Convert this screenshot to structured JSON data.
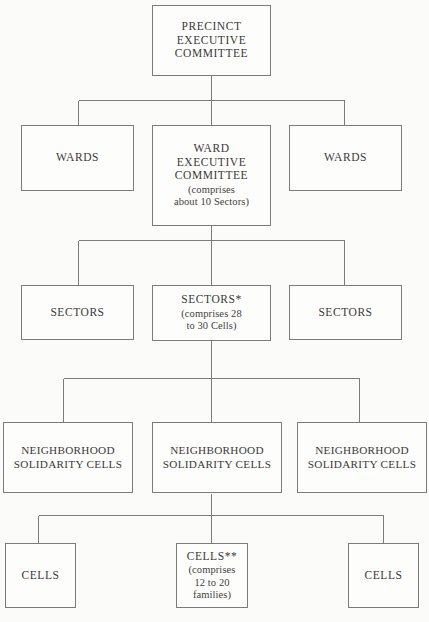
{
  "diagram": {
    "background_color": "#fbfbf9",
    "line_color": "#7c7c7c",
    "text_color": "#3a3a3a",
    "levels": [
      {
        "level": 1,
        "name": "precinct",
        "nodes": [
          {
            "id": "precinct-executive-committee",
            "title": "PRECINCT\nEXECUTIVE\nCOMMITTEE",
            "sub": ""
          }
        ]
      },
      {
        "level": 2,
        "name": "wards",
        "nodes": [
          {
            "id": "wards-left",
            "title": "WARDS",
            "sub": ""
          },
          {
            "id": "ward-executive-committee",
            "title": "WARD\nEXECUTIVE\nCOMMITTEE",
            "sub": "(comprises\nabout 10 Sectors)"
          },
          {
            "id": "wards-right",
            "title": "WARDS",
            "sub": ""
          }
        ]
      },
      {
        "level": 3,
        "name": "sectors",
        "nodes": [
          {
            "id": "sectors-left",
            "title": "SECTORS",
            "sub": ""
          },
          {
            "id": "sectors-center",
            "title": "SECTORS*",
            "sub": "(comprises 28\nto 30 Cells)"
          },
          {
            "id": "sectors-right",
            "title": "SECTORS",
            "sub": ""
          }
        ]
      },
      {
        "level": 4,
        "name": "neighborhood-solidarity-cells",
        "nodes": [
          {
            "id": "neighborhood-solidarity-cells-left",
            "title": "NEIGHBORHOOD\nSOLIDARITY CELLS",
            "sub": ""
          },
          {
            "id": "neighborhood-solidarity-cells-center",
            "title": "NEIGHBORHOOD\nSOLIDARITY CELLS",
            "sub": ""
          },
          {
            "id": "neighborhood-solidarity-cells-right",
            "title": "NEIGHBORHOOD\nSOLIDARITY CELLS",
            "sub": ""
          }
        ]
      },
      {
        "level": 5,
        "name": "cells",
        "nodes": [
          {
            "id": "cells-left",
            "title": "CELLS",
            "sub": ""
          },
          {
            "id": "cells-center",
            "title": "CELLS**",
            "sub": "(comprises\n12 to 20\nfamilies)"
          },
          {
            "id": "cells-right",
            "title": "CELLS",
            "sub": ""
          }
        ]
      }
    ]
  }
}
